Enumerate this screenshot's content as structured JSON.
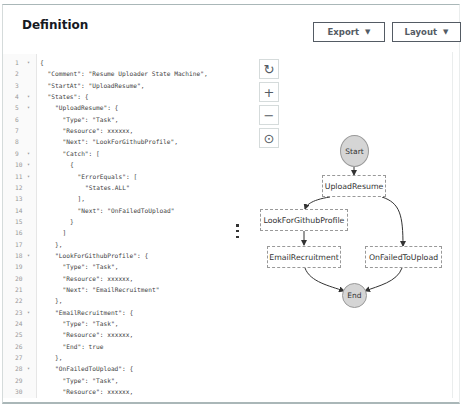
{
  "panel": {
    "title": "Definition",
    "export_label": "Export",
    "layout_label": "Layout",
    "caret": "▼"
  },
  "editor": {
    "lines": [
      {
        "n": "1",
        "fold": true,
        "indent": 0,
        "text": "{"
      },
      {
        "n": "2",
        "fold": false,
        "indent": 1,
        "text": "\"Comment\": \"Resume Uploader State Machine\","
      },
      {
        "n": "3",
        "fold": false,
        "indent": 1,
        "text": "\"StartAt\": \"UploadResume\","
      },
      {
        "n": "4",
        "fold": true,
        "indent": 1,
        "text": "\"States\": {"
      },
      {
        "n": "5",
        "fold": true,
        "indent": 2,
        "text": "\"UploadResume\": {"
      },
      {
        "n": "6",
        "fold": false,
        "indent": 3,
        "text": "\"Type\": \"Task\","
      },
      {
        "n": "7",
        "fold": false,
        "indent": 3,
        "text": "\"Resource\": xxxxxx,"
      },
      {
        "n": "8",
        "fold": false,
        "indent": 3,
        "text": "\"Next\": \"LookForGithubProfile\","
      },
      {
        "n": "9",
        "fold": true,
        "indent": 3,
        "text": "\"Catch\": ["
      },
      {
        "n": "10",
        "fold": true,
        "indent": 4,
        "text": "{"
      },
      {
        "n": "11",
        "fold": true,
        "indent": 5,
        "text": "\"ErrorEquals\": ["
      },
      {
        "n": "12",
        "fold": false,
        "indent": 6,
        "text": "\"States.ALL\""
      },
      {
        "n": "13",
        "fold": false,
        "indent": 5,
        "text": "],"
      },
      {
        "n": "14",
        "fold": false,
        "indent": 5,
        "text": "\"Next\": \"OnFailedToUpload\""
      },
      {
        "n": "15",
        "fold": false,
        "indent": 4,
        "text": "}"
      },
      {
        "n": "16",
        "fold": false,
        "indent": 3,
        "text": "]"
      },
      {
        "n": "17",
        "fold": false,
        "indent": 2,
        "text": "},"
      },
      {
        "n": "18",
        "fold": true,
        "indent": 2,
        "text": "\"LookForGithubProfile\": {"
      },
      {
        "n": "19",
        "fold": false,
        "indent": 3,
        "text": "\"Type\": \"Task\","
      },
      {
        "n": "20",
        "fold": false,
        "indent": 3,
        "text": "\"Resource\": xxxxxx,"
      },
      {
        "n": "21",
        "fold": false,
        "indent": 3,
        "text": "\"Next\": \"EmailRecruitment\""
      },
      {
        "n": "22",
        "fold": false,
        "indent": 2,
        "text": "},"
      },
      {
        "n": "23",
        "fold": true,
        "indent": 2,
        "text": "\"EmailRecruitment\": {"
      },
      {
        "n": "24",
        "fold": false,
        "indent": 3,
        "text": "\"Type\": \"Task\","
      },
      {
        "n": "25",
        "fold": false,
        "indent": 3,
        "text": "\"Resource\": xxxxxx,"
      },
      {
        "n": "26",
        "fold": false,
        "indent": 3,
        "text": "\"End\": true"
      },
      {
        "n": "27",
        "fold": false,
        "indent": 2,
        "text": "},"
      },
      {
        "n": "28",
        "fold": true,
        "indent": 2,
        "text": "\"OnFailedToUpload\": {"
      },
      {
        "n": "29",
        "fold": false,
        "indent": 3,
        "text": "\"Type\": \"Task\","
      },
      {
        "n": "30",
        "fold": false,
        "indent": 3,
        "text": "\"Resource\": xxxxxx,"
      }
    ]
  },
  "graph_controls": {
    "reset": "↻",
    "zoom_in": "+",
    "zoom_out": "−",
    "center": "⊙"
  },
  "graph": {
    "start": "Start",
    "end": "End",
    "states": {
      "upload_resume": "UploadResume",
      "look_for_github": "LookForGithubProfile",
      "email_recruitment": "EmailRecruitment",
      "on_failed": "OnFailedToUpload"
    }
  }
}
